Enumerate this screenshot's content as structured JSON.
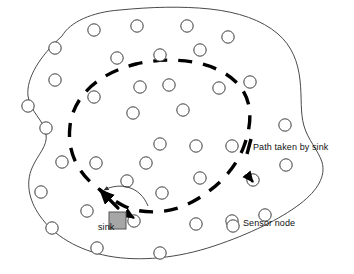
{
  "figure": {
    "background": "#ffffff",
    "width": 354,
    "height": 274,
    "colors": {
      "boundary_stroke": "#4a4a4a",
      "node_stroke": "#3c3c3c",
      "node_fill": "#ffffff",
      "path_stroke": "#000000",
      "sink_fill": "#a6a6a6",
      "sink_stroke": "#555555",
      "text": "#111111",
      "arrow_stroke": "#333333"
    }
  },
  "labels": {
    "sink": "sink",
    "path_legend": "Path taken by sink",
    "node_legend": "Sensor node"
  },
  "legend": [
    {
      "marker": "thick-dash",
      "label": "Path taken by sink"
    },
    {
      "marker": "circle-outline",
      "label": "Sensor node"
    }
  ],
  "deployment_area": {
    "shape": "irregular-blob",
    "outline_path": "M 62,36 C 70,22 92,12 120,10 C 150,7 182,6 210,9 C 238,12 262,20 278,34 C 292,46 298,62 300,80 C 302,98 300,112 304,126 C 308,140 318,150 322,162 C 326,176 318,190 300,204 C 280,219 250,234 214,246 C 178,258 140,262 108,256 C 78,250 54,236 40,216 C 28,199 26,182 32,168 C 38,154 48,146 46,134 C 44,120 30,112 28,96 C 26,78 40,56 62,36 Z"
  },
  "sink": {
    "x": 109,
    "y": 212,
    "size": 17,
    "shape": "square"
  },
  "sink_path": {
    "type": "closed-dashed-loop",
    "stroke_width": 3.4,
    "dash_pattern": "14 11",
    "path": "M 110,196 C 84,182 66,158 70,126 C 73,98 96,74 136,64 C 176,55 216,62 236,82 C 254,100 252,124 244,146 C 236,168 218,188 192,202 C 168,215 140,214 124,206 C 116,202 112,199 110,196 Z"
  },
  "arrows": [
    {
      "name": "sink-direction-arrow",
      "type": "straight",
      "from": [
        118,
        208
      ],
      "to": [
        100,
        190
      ]
    },
    {
      "name": "sink-pointer-arrow",
      "type": "curved",
      "from": [
        148,
        206
      ],
      "to": [
        104,
        190
      ]
    },
    {
      "name": "node-tick-arrow",
      "type": "short-tick",
      "at": [
        134,
        218
      ]
    },
    {
      "name": "node-tick-arrow-right",
      "type": "short-tick",
      "at": [
        253,
        182
      ]
    }
  ],
  "sensor_nodes": [
    {
      "cx": 94,
      "cy": 30
    },
    {
      "cx": 137,
      "cy": 26
    },
    {
      "cx": 187,
      "cy": 26
    },
    {
      "cx": 228,
      "cy": 37
    },
    {
      "cx": 55,
      "cy": 48
    },
    {
      "cx": 160,
      "cy": 55
    },
    {
      "cx": 200,
      "cy": 50
    },
    {
      "cx": 55,
      "cy": 80
    },
    {
      "cx": 94,
      "cy": 97
    },
    {
      "cx": 117,
      "cy": 58
    },
    {
      "cx": 140,
      "cy": 87
    },
    {
      "cx": 169,
      "cy": 85
    },
    {
      "cx": 219,
      "cy": 88
    },
    {
      "cx": 250,
      "cy": 82
    },
    {
      "cx": 28,
      "cy": 106
    },
    {
      "cx": 46,
      "cy": 128
    },
    {
      "cx": 133,
      "cy": 113
    },
    {
      "cx": 183,
      "cy": 110
    },
    {
      "cx": 285,
      "cy": 125
    },
    {
      "cx": 160,
      "cy": 144
    },
    {
      "cx": 196,
      "cy": 146
    },
    {
      "cx": 232,
      "cy": 146
    },
    {
      "cx": 62,
      "cy": 162
    },
    {
      "cx": 96,
      "cy": 163
    },
    {
      "cx": 146,
      "cy": 163
    },
    {
      "cx": 127,
      "cy": 181
    },
    {
      "cx": 200,
      "cy": 178
    },
    {
      "cx": 253,
      "cy": 180
    },
    {
      "cx": 286,
      "cy": 165
    },
    {
      "cx": 41,
      "cy": 192
    },
    {
      "cx": 87,
      "cy": 211
    },
    {
      "cx": 162,
      "cy": 193
    },
    {
      "cx": 52,
      "cy": 228
    },
    {
      "cx": 134,
      "cy": 221
    },
    {
      "cx": 196,
      "cy": 224
    },
    {
      "cx": 232,
      "cy": 221
    },
    {
      "cx": 97,
      "cy": 248
    },
    {
      "cx": 160,
      "cy": 253
    },
    {
      "cx": 265,
      "cy": 215
    }
  ],
  "node_radius": 6.2
}
